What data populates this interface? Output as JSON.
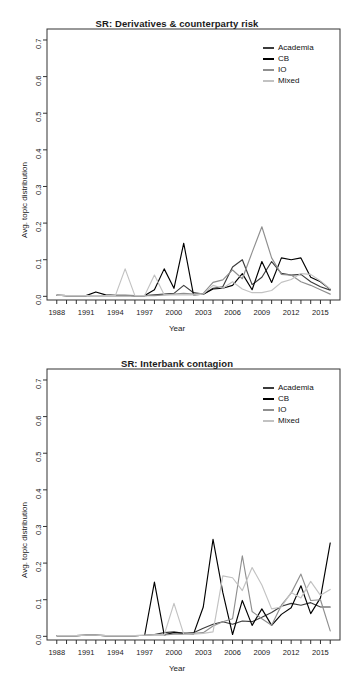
{
  "page": {
    "background": "#ffffff",
    "width": 354,
    "height": 680
  },
  "panels": [
    {
      "id": "panel-derivatives",
      "title": "SR: Derivatives & counterparty risk",
      "xlabel": "Year",
      "ylabel": "Avg. topic distribution"
    },
    {
      "id": "panel-interbank",
      "title": "SR: Interbank contagion",
      "xlabel": "Year",
      "ylabel": "Avg. topic distribution"
    }
  ],
  "legend": {
    "entries": [
      {
        "label": "Academia",
        "color": "#3b3b3b"
      },
      {
        "label": "CB",
        "color": "#000000"
      },
      {
        "label": "IO",
        "color": "#8f8f8f"
      },
      {
        "label": "Mixed",
        "color": "#c2c2c2"
      }
    ]
  },
  "axes": {
    "y_ticks": [
      "0.0",
      "0.1",
      "0.2",
      "0.3",
      "0.4",
      "0.5",
      "0.6",
      "0.7"
    ],
    "y_values": [
      0.0,
      0.1,
      0.2,
      0.3,
      0.4,
      0.5,
      0.6,
      0.7
    ],
    "ylim": [
      -0.01,
      0.73
    ],
    "x_ticks": [
      "1988",
      "1991",
      "1994",
      "1997",
      "2000",
      "2003",
      "2006",
      "2009",
      "2012",
      "2015"
    ],
    "x_values": [
      1988,
      1991,
      1994,
      1997,
      2000,
      2003,
      2006,
      2009,
      2012,
      2015
    ],
    "xlim": [
      1987,
      2017
    ],
    "x_minor_start": 1988,
    "x_minor_end": 2016,
    "grid": false
  },
  "chart_data": [
    {
      "type": "line",
      "title": "SR: Derivatives & counterparty risk",
      "xlabel": "Year",
      "ylabel": "Avg. topic distribution",
      "ylim": [
        0.0,
        0.7
      ],
      "xlim": [
        1987,
        2017
      ],
      "grid": false,
      "legend_position": "top-right",
      "x": [
        1988,
        1989,
        1990,
        1991,
        1992,
        1993,
        1994,
        1995,
        1996,
        1997,
        1998,
        1999,
        2000,
        2001,
        2002,
        2003,
        2004,
        2005,
        2006,
        2007,
        2008,
        2009,
        2010,
        2011,
        2012,
        2013,
        2014,
        2015,
        2016
      ],
      "series": [
        {
          "name": "Academia",
          "color": "#3b3b3b",
          "values": [
            0.003,
            0.002,
            0.002,
            0.002,
            0.002,
            0.002,
            0.002,
            0.002,
            0.002,
            0.002,
            0.004,
            0.006,
            0.008,
            0.03,
            0.01,
            0.006,
            0.022,
            0.026,
            0.08,
            0.1,
            0.032,
            0.052,
            0.095,
            0.063,
            0.058,
            0.06,
            0.04,
            0.026,
            0.017
          ]
        },
        {
          "name": "CB",
          "color": "#000000",
          "values": [
            0.003,
            0.002,
            0.002,
            0.002,
            0.012,
            0.004,
            0.003,
            0.003,
            0.002,
            0.002,
            0.018,
            0.075,
            0.022,
            0.145,
            0.004,
            0.006,
            0.02,
            0.022,
            0.03,
            0.062,
            0.018,
            0.095,
            0.038,
            0.105,
            0.1,
            0.105,
            0.052,
            0.04,
            0.019
          ]
        },
        {
          "name": "IO",
          "color": "#8f8f8f",
          "values": [
            0.003,
            0.002,
            0.002,
            0.002,
            0.002,
            0.002,
            0.002,
            0.002,
            0.002,
            0.002,
            0.002,
            0.004,
            0.006,
            0.008,
            0.006,
            0.008,
            0.038,
            0.045,
            0.072,
            0.048,
            0.12,
            0.19,
            0.105,
            0.06,
            0.058,
            0.04,
            0.03,
            0.018,
            0.006
          ]
        },
        {
          "name": "Mixed",
          "color": "#c2c2c2",
          "values": [
            0.003,
            0.002,
            0.002,
            0.002,
            0.002,
            0.002,
            0.002,
            0.075,
            0.002,
            0.002,
            0.058,
            0.004,
            0.004,
            0.004,
            0.004,
            0.006,
            0.03,
            0.022,
            0.04,
            0.02,
            0.01,
            0.01,
            0.016,
            0.038,
            0.046,
            0.062,
            0.06,
            0.042,
            0.02
          ]
        }
      ]
    },
    {
      "type": "line",
      "title": "SR: Interbank contagion",
      "xlabel": "Year",
      "ylabel": "Avg. topic distribution",
      "ylim": [
        0.0,
        0.7
      ],
      "xlim": [
        1987,
        2017
      ],
      "grid": false,
      "legend_position": "top-right",
      "x": [
        1988,
        1989,
        1990,
        1991,
        1992,
        1993,
        1994,
        1995,
        1996,
        1997,
        1998,
        1999,
        2000,
        2001,
        2002,
        2003,
        2004,
        2005,
        2006,
        2007,
        2008,
        2009,
        2010,
        2011,
        2012,
        2013,
        2014,
        2015,
        2016
      ],
      "series": [
        {
          "name": "Academia",
          "color": "#3b3b3b",
          "values": [
            0.002,
            0.002,
            0.002,
            0.003,
            0.003,
            0.002,
            0.002,
            0.002,
            0.002,
            0.003,
            0.005,
            0.01,
            0.012,
            0.008,
            0.01,
            0.022,
            0.033,
            0.04,
            0.033,
            0.042,
            0.04,
            0.052,
            0.065,
            0.082,
            0.09,
            0.085,
            0.092,
            0.08,
            0.08
          ]
        },
        {
          "name": "CB",
          "color": "#000000",
          "values": [
            0.002,
            0.002,
            0.002,
            0.003,
            0.003,
            0.002,
            0.002,
            0.002,
            0.002,
            0.003,
            0.148,
            0.004,
            0.01,
            0.008,
            0.006,
            0.08,
            0.265,
            0.12,
            0.005,
            0.098,
            0.03,
            0.075,
            0.03,
            0.06,
            0.078,
            0.138,
            0.062,
            0.105,
            0.255
          ]
        },
        {
          "name": "IO",
          "color": "#8f8f8f",
          "values": [
            0.002,
            0.002,
            0.002,
            0.003,
            0.003,
            0.002,
            0.002,
            0.002,
            0.002,
            0.003,
            0.004,
            0.004,
            0.006,
            0.006,
            0.008,
            0.01,
            0.028,
            0.04,
            0.048,
            0.22,
            0.068,
            0.048,
            0.03,
            0.085,
            0.118,
            0.17,
            0.098,
            0.1,
            0.015
          ]
        },
        {
          "name": "Mixed",
          "color": "#c2c2c2",
          "values": [
            0.002,
            0.002,
            0.002,
            0.003,
            0.003,
            0.002,
            0.002,
            0.002,
            0.002,
            0.003,
            0.004,
            0.004,
            0.09,
            0.006,
            0.006,
            0.008,
            0.012,
            0.165,
            0.16,
            0.125,
            0.188,
            0.14,
            0.075,
            0.08,
            0.12,
            0.105,
            0.15,
            0.112,
            0.128
          ]
        }
      ]
    }
  ]
}
